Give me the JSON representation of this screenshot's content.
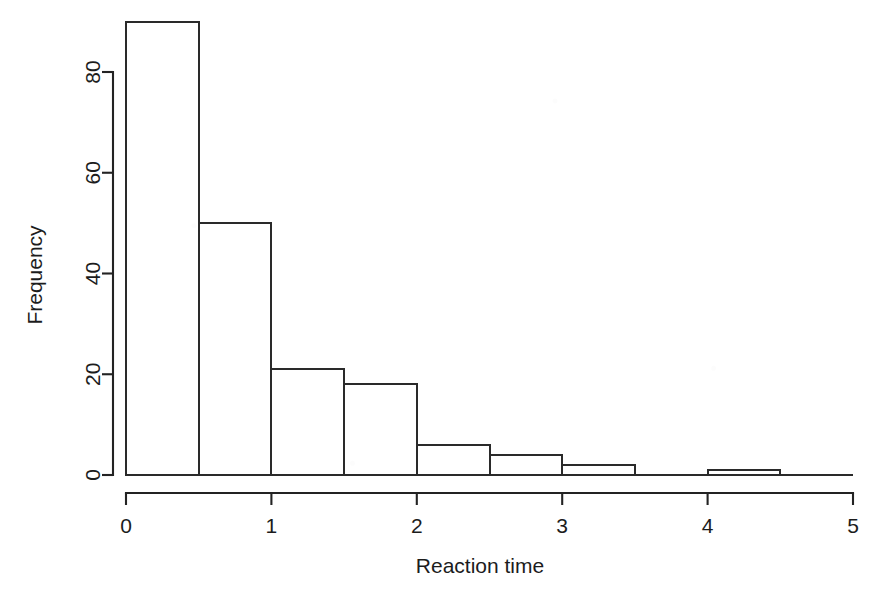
{
  "chart_data": {
    "type": "bar",
    "title": "",
    "subtitle": "",
    "xlabel": "Reaction time",
    "ylabel": "Frequency",
    "xlim": [
      0,
      5
    ],
    "ylim": [
      0,
      90
    ],
    "grid": false,
    "legend": null,
    "bin_width": 0.5,
    "bin_edges": [
      0,
      0.5,
      1,
      1.5,
      2,
      2.5,
      3,
      3.5,
      4,
      4.5,
      5
    ],
    "categories": [
      "0-0.5",
      "0.5-1",
      "1-1.5",
      "1.5-2",
      "2-2.5",
      "2.5-3",
      "3-3.5",
      "3.5-4",
      "4-4.5",
      "4.5-5"
    ],
    "values": [
      90,
      50,
      21,
      18,
      6,
      4,
      2,
      0,
      1,
      0
    ],
    "x_ticks": [
      0,
      1,
      2,
      3,
      4,
      5
    ],
    "x_tick_labels": [
      "0",
      "1",
      "2",
      "3",
      "4",
      "5"
    ],
    "y_ticks": [
      0,
      20,
      40,
      60,
      80
    ],
    "y_tick_labels": [
      "0",
      "20",
      "40",
      "60",
      "80"
    ],
    "bar_fill": "#ffffff",
    "bar_stroke": "#2a2a2a",
    "axis_color": "#232323",
    "background": "#ffffff"
  },
  "labels": {
    "x_axis_title": "Reaction time",
    "y_axis_title": "Frequency"
  }
}
